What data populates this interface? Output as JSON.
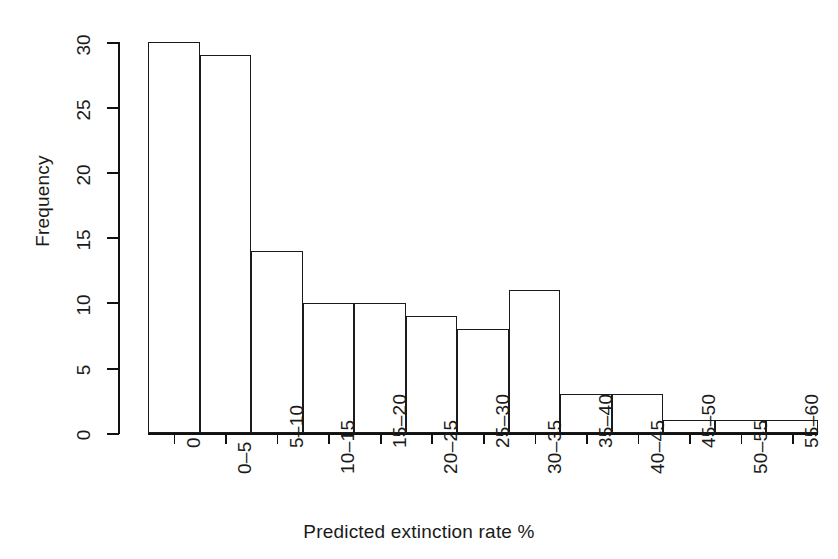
{
  "chart_data": {
    "type": "bar",
    "title": "",
    "subtitle": "",
    "xlabel": "Predicted extinction rate %",
    "ylabel": "Frequency",
    "categories": [
      "0",
      "0–5",
      "5–10",
      "10–15",
      "15–20",
      "20–25",
      "25–30",
      "30–35",
      "35–40",
      "40–45",
      "45–50",
      "50–55",
      "55–60"
    ],
    "values": [
      30,
      29,
      14,
      10,
      10,
      9,
      8,
      11,
      3,
      3,
      1,
      1,
      1
    ],
    "ylim": [
      0,
      30
    ],
    "yticks": [
      0,
      5,
      10,
      15,
      20,
      25,
      30
    ],
    "ytick_labels": [
      "0",
      "5",
      "10",
      "15",
      "20",
      "25",
      "30"
    ],
    "grid": false,
    "legend": false,
    "legend_position": "none",
    "bar_fill": "#ffffff",
    "bar_edge": "#1b1b1b",
    "axis_color": "#111111",
    "background": "#ffffff",
    "xtick_rotation_degrees": 90,
    "ytick_rotation_degrees": 90
  },
  "axes": {
    "y_axis_name": "frequency-axis",
    "x_axis_name": "category-axis"
  }
}
